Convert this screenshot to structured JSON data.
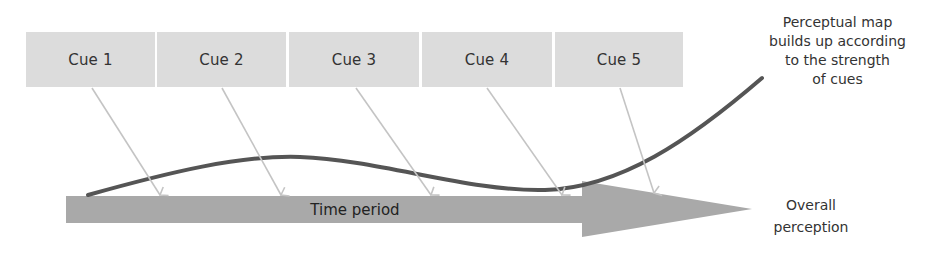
{
  "cues": [
    {
      "label": "Cue 1"
    },
    {
      "label": "Cue 2"
    },
    {
      "label": "Cue 3"
    },
    {
      "label": "Cue 4"
    },
    {
      "label": "Cue 5"
    }
  ],
  "timeline": {
    "label": "Time period"
  },
  "annotations": {
    "perceptual_map": [
      "Perceptual map",
      "builds up according",
      "to the strength",
      "of cues"
    ],
    "overall_perception": [
      "Overall",
      "perception"
    ]
  },
  "colors": {
    "cue_box": "#dcdcdc",
    "timeline_arrow": "#a9a9a9",
    "cue_connector": "#c4c4c4",
    "perception_curve": "#555555",
    "text": "#333333"
  }
}
